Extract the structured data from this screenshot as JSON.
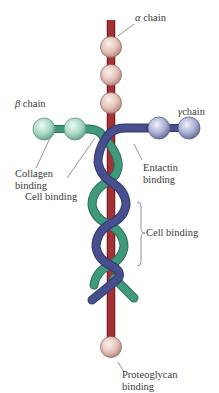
{
  "diagram": {
    "chains": [
      {
        "id": "alpha",
        "symbol": "α",
        "label": "chain",
        "color": "#9b2e30",
        "bead_color": "#eccfc6"
      },
      {
        "id": "beta",
        "symbol": "β",
        "label": "chain",
        "color": "#3f9a7c",
        "bead_color": "#b9e2d2"
      },
      {
        "id": "gamma",
        "symbol": "γ",
        "label": "chain",
        "color": "#474f8e",
        "bead_color": "#b9bfdc"
      }
    ],
    "annotations": {
      "collagen_binding": [
        "Collagen",
        "binding"
      ],
      "cell_binding_top": "Cell binding",
      "entactin_binding": [
        "Entactin",
        "binding"
      ],
      "cell_binding_mid": "Cell binding",
      "proteoglycan_binding": [
        "Proteoglycan",
        "binding"
      ]
    }
  }
}
